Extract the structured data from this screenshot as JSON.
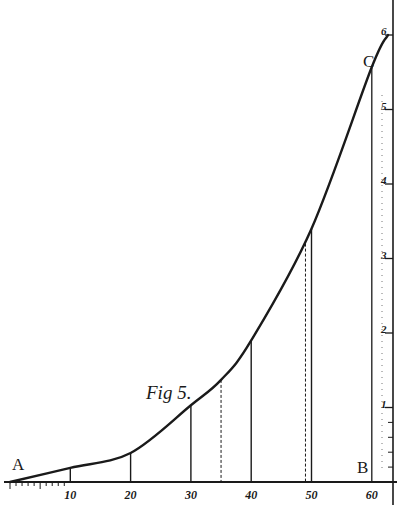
{
  "header_fragment": "...g p...",
  "figure": {
    "label": "Fig 5.",
    "point_labels": {
      "A": "A",
      "B": "B",
      "C": "C"
    }
  },
  "chart_data": {
    "type": "line",
    "title": "Fig 5.",
    "xlabel": "",
    "ylabel": "",
    "x_ticks": [
      10,
      20,
      30,
      40,
      50,
      60
    ],
    "x_tick_labels": [
      "10",
      "20",
      "30",
      "40",
      "50",
      "60"
    ],
    "y_ticks": [
      1,
      2,
      3,
      4,
      5,
      6
    ],
    "y_tick_labels": [
      "1",
      "2",
      "3",
      "4",
      "5",
      "6"
    ],
    "xlim": [
      0,
      63
    ],
    "ylim": [
      0,
      6
    ],
    "grid": false,
    "series": [
      {
        "name": "curve A-C",
        "x": [
          0,
          10,
          20,
          30,
          35,
          40,
          50,
          60,
          62.7
        ],
        "y": [
          0,
          0.19,
          0.39,
          1.03,
          1.37,
          1.9,
          3.4,
          5.57,
          6.0
        ]
      }
    ],
    "ordinates": [
      {
        "x": 10,
        "height": 0.19,
        "style": "solid"
      },
      {
        "x": 20,
        "height": 0.39,
        "style": "solid"
      },
      {
        "x": 30,
        "height": 1.03,
        "style": "solid"
      },
      {
        "x": 35,
        "height": 1.37,
        "style": "dashed"
      },
      {
        "x": 40,
        "height": 1.9,
        "style": "solid"
      },
      {
        "x": 49,
        "height": 3.2,
        "style": "dashed"
      },
      {
        "x": 50,
        "height": 3.4,
        "style": "solid"
      },
      {
        "x": 60,
        "height": 5.57,
        "style": "solid"
      }
    ],
    "annotations": [
      "A",
      "B",
      "C",
      "Fig 5."
    ]
  }
}
